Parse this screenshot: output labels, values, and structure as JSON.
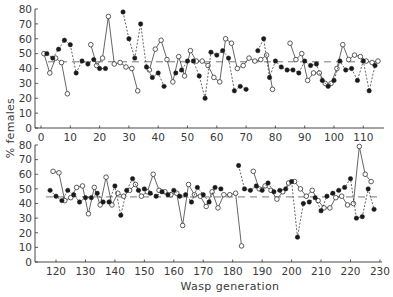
{
  "chart_data": {
    "type": "line",
    "title": "",
    "xlabel": "Wasp generation",
    "ylabel": "% females",
    "grid": false,
    "legend": null,
    "ink_color": "#333333",
    "panels": [
      {
        "name": "generations 0-115",
        "xlim": [
          0,
          115
        ],
        "ylim": [
          0,
          80
        ],
        "xticks": [
          0,
          10,
          20,
          30,
          40,
          50,
          60,
          70,
          80,
          90,
          100,
          110
        ],
        "yticks": [
          0,
          10,
          20,
          30,
          40,
          50,
          60,
          70,
          80
        ],
        "reference_line": 44.5,
        "series": [
          {
            "name": "open circles (solid line)",
            "marker": "open-circle",
            "line": "solid",
            "segments": [
              [
                [
                  1,
                  50
                ],
                [
                  3,
                  37
                ],
                [
                  5,
                  47
                ],
                [
                  7,
                  44
                ],
                [
                  9,
                  23
                ]
              ],
              [
                [
                  17,
                  56
                ],
                [
                  19,
                  42
                ],
                [
                  21,
                  47
                ],
                [
                  23,
                  75
                ],
                [
                  25,
                  43
                ],
                [
                  27,
                  44
                ],
                [
                  29,
                  41
                ],
                [
                  31,
                  40
                ],
                [
                  33,
                  25
                ]
              ],
              [
                [
                  37,
                  39
                ],
                [
                  39,
                  53
                ],
                [
                  41,
                  59
                ],
                [
                  43,
                  46
                ],
                [
                  45,
                  31
                ],
                [
                  47,
                  48
                ],
                [
                  49,
                  35
                ],
                [
                  51,
                  52
                ],
                [
                  53,
                  45
                ],
                [
                  55,
                  45
                ],
                [
                  57,
                  42
                ],
                [
                  59,
                  34
                ],
                [
                  61,
                  31
                ],
                [
                  63,
                  60
                ],
                [
                  65,
                  57
                ],
                [
                  67,
                  40
                ],
                [
                  69,
                  42
                ],
                [
                  71,
                  47
                ],
                [
                  73,
                  45
                ],
                [
                  75,
                  46
                ],
                [
                  77,
                  49
                ],
                [
                  79,
                  26
                ]
              ],
              [
                [
                  85,
                  57
                ],
                [
                  87,
                  46
                ],
                [
                  89,
                  50
                ],
                [
                  91,
                  32
                ],
                [
                  93,
                  37
                ],
                [
                  95,
                  37
                ],
                [
                  97,
                  30
                ],
                [
                  99,
                  30
                ],
                [
                  101,
                  40
                ],
                [
                  103,
                  56
                ],
                [
                  105,
                  46
                ],
                [
                  107,
                  49
                ],
                [
                  109,
                  48
                ],
                [
                  111,
                  45
                ],
                [
                  113,
                  44
                ],
                [
                  115,
                  45
                ]
              ]
            ]
          },
          {
            "name": "filled circles (dashed line)",
            "marker": "filled-circle",
            "line": "dashed",
            "segments": [
              [
                [
                  2,
                  50
                ],
                [
                  4,
                  47
                ],
                [
                  6,
                  53
                ],
                [
                  8,
                  59
                ],
                [
                  10,
                  56
                ],
                [
                  12,
                  37
                ],
                [
                  14,
                  45
                ],
                [
                  16,
                  43
                ],
                [
                  18,
                  46
                ],
                [
                  20,
                  40
                ],
                [
                  22,
                  40
                ]
              ],
              [
                [
                  28,
                  78
                ],
                [
                  30,
                  60
                ],
                [
                  32,
                  47
                ],
                [
                  34,
                  70
                ],
                [
                  36,
                  41
                ],
                [
                  38,
                  34
                ],
                [
                  40,
                  37
                ],
                [
                  42,
                  28
                ]
              ],
              [
                [
                  46,
                  37
                ],
                [
                  48,
                  39
                ],
                [
                  50,
                  45
                ],
                [
                  52,
                  45
                ],
                [
                  54,
                  35
                ],
                [
                  56,
                  20
                ],
                [
                  58,
                  51
                ],
                [
                  60,
                  49
                ],
                [
                  62,
                  52
                ],
                [
                  64,
                  47
                ],
                [
                  66,
                  25
                ],
                [
                  68,
                  28
                ],
                [
                  70,
                  26
                ]
              ],
              [
                [
                  74,
                  52
                ],
                [
                  76,
                  60
                ],
                [
                  78,
                  34
                ],
                [
                  80,
                  45
                ],
                [
                  82,
                  41
                ],
                [
                  84,
                  39
                ],
                [
                  86,
                  39
                ],
                [
                  88,
                  37
                ],
                [
                  90,
                  45
                ],
                [
                  92,
                  42
                ],
                [
                  94,
                  43
                ],
                [
                  96,
                  32
                ],
                [
                  98,
                  28
                ],
                [
                  100,
                  32
                ],
                [
                  102,
                  45
                ],
                [
                  104,
                  39
                ],
                [
                  106,
                  40
                ],
                [
                  108,
                  32
                ],
                [
                  110,
                  45
                ],
                [
                  112,
                  25
                ],
                [
                  114,
                  42
                ]
              ]
            ]
          }
        ]
      },
      {
        "name": "generations 115-230",
        "xlim": [
          115,
          230
        ],
        "ylim": [
          0,
          80
        ],
        "xticks": [
          120,
          130,
          140,
          150,
          160,
          170,
          180,
          190,
          200,
          210,
          220,
          230
        ],
        "yticks": [
          0,
          10,
          20,
          30,
          40,
          50,
          60,
          70,
          80
        ],
        "reference_line": 44.5,
        "series": [
          {
            "name": "open circles (solid line)",
            "marker": "open-circle",
            "line": "solid",
            "segments": [
              [
                [
                  119,
                  62
                ],
                [
                  121,
                  61
                ],
                [
                  123,
                  42
                ],
                [
                  125,
                  44
                ],
                [
                  127,
                  51
                ],
                [
                  129,
                  52
                ],
                [
                  131,
                  33
                ],
                [
                  133,
                  51
                ],
                [
                  135,
                  39
                ],
                [
                  137,
                  58
                ],
                [
                  139,
                  39
                ],
                [
                  141,
                  47
                ],
                [
                  143,
                  45
                ],
                [
                  145,
                  49
                ],
                [
                  147,
                  53
                ],
                [
                  149,
                  45
                ],
                [
                  151,
                  48
                ],
                [
                  153,
                  60
                ],
                [
                  155,
                  49
                ],
                [
                  157,
                  48
                ],
                [
                  159,
                  46
                ],
                [
                  161,
                  47
                ],
                [
                  163,
                  25
                ],
                [
                  165,
                  53
                ],
                [
                  167,
                  46
                ],
                [
                  169,
                  45
                ],
                [
                  171,
                  38
                ],
                [
                  173,
                  48
                ],
                [
                  175,
                  37
                ],
                [
                  177,
                  46
                ],
                [
                  179,
                  46
                ],
                [
                  181,
                  47
                ],
                [
                  183,
                  11
                ]
              ],
              [
                [
                  187,
                  62
                ],
                [
                  189,
                  50
                ],
                [
                  191,
                  52
                ],
                [
                  193,
                  49
                ],
                [
                  195,
                  43
                ],
                [
                  197,
                  48
                ],
                [
                  199,
                  54
                ],
                [
                  201,
                  55
                ],
                [
                  203,
                  50
                ],
                [
                  205,
                  45
                ],
                [
                  207,
                  49
                ],
                [
                  209,
                  42
                ],
                [
                  211,
                  37
                ],
                [
                  213,
                  37
                ],
                [
                  215,
                  44
                ],
                [
                  217,
                  45
                ],
                [
                  219,
                  39
                ],
                [
                  221,
                  40
                ],
                [
                  223,
                  79
                ],
                [
                  225,
                  60
                ],
                [
                  227,
                  55
                ]
              ]
            ]
          },
          {
            "name": "filled circles (dashed line)",
            "marker": "filled-circle",
            "line": "dashed",
            "segments": [
              [
                [
                  118,
                  49
                ],
                [
                  120,
                  45
                ],
                [
                  122,
                  42
                ],
                [
                  124,
                  49
                ],
                [
                  126,
                  46
                ],
                [
                  128,
                  41
                ],
                [
                  130,
                  44
                ],
                [
                  132,
                  44
                ],
                [
                  134,
                  47
                ],
                [
                  136,
                  41
                ],
                [
                  138,
                  41
                ],
                [
                  140,
                  52
                ],
                [
                  142,
                  32
                ],
                [
                  144,
                  49
                ],
                [
                  146,
                  57
                ],
                [
                  148,
                  49
                ],
                [
                  150,
                  50
                ],
                [
                  152,
                  47
                ],
                [
                  154,
                  45
                ],
                [
                  156,
                  48
                ],
                [
                  158,
                  46
                ],
                [
                  160,
                  49
                ],
                [
                  162,
                  45
                ],
                [
                  164,
                  46
                ],
                [
                  166,
                  41
                ],
                [
                  168,
                  51
                ],
                [
                  170,
                  46
                ],
                [
                  172,
                  41
                ],
                [
                  174,
                  51
                ],
                [
                  176,
                  50
                ]
              ],
              [
                [
                  182,
                  66
                ],
                [
                  184,
                  50
                ],
                [
                  186,
                  49
                ],
                [
                  188,
                  52
                ],
                [
                  190,
                  49
                ],
                [
                  192,
                  54
                ],
                [
                  194,
                  48
                ],
                [
                  196,
                  49
                ],
                [
                  198,
                  50
                ],
                [
                  200,
                  55
                ],
                [
                  202,
                  17
                ],
                [
                  204,
                  40
                ],
                [
                  206,
                  41
                ],
                [
                  208,
                  44
                ],
                [
                  210,
                  35
                ],
                [
                  212,
                  45
                ],
                [
                  214,
                  47
                ],
                [
                  216,
                  49
                ],
                [
                  218,
                  51
                ],
                [
                  220,
                  57
                ],
                [
                  222,
                  30
                ],
                [
                  224,
                  31
                ],
                [
                  226,
                  50
                ],
                [
                  228,
                  36
                ]
              ]
            ]
          }
        ]
      }
    ]
  }
}
